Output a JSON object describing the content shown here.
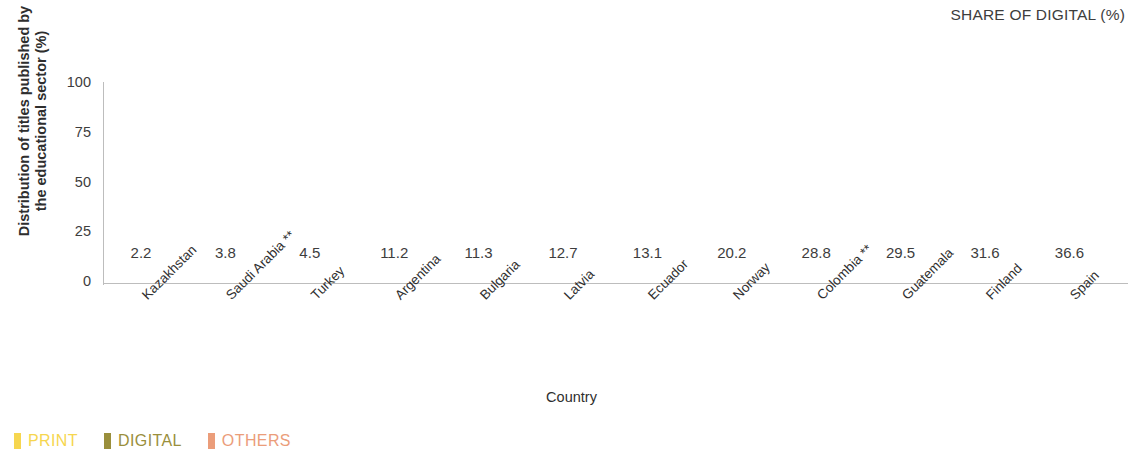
{
  "header": {
    "share_of_digital_title": "SHARE OF DIGITAL (%)"
  },
  "axes": {
    "y_title": "Distribution of titles published by the educational sector (%)",
    "x_title": "Country",
    "y_ticks": [
      "100",
      "75",
      "50",
      "25",
      "0"
    ]
  },
  "legend": {
    "items": [
      {
        "label": "PRINT",
        "color": "#f6d64f"
      },
      {
        "label": "DIGITAL",
        "color": "#9a8f3c"
      },
      {
        "label": "OTHERS",
        "color": "#eb9d7a"
      }
    ]
  },
  "chart_data": {
    "type": "bar",
    "title": "",
    "subtitle": "",
    "xlabel": "Country",
    "ylabel": "Distribution of titles published by the educational sector (%)",
    "ylim": [
      0,
      100
    ],
    "yticks": [
      0,
      25,
      50,
      75,
      100
    ],
    "grid": false,
    "stacked": true,
    "legend_position": "bottom-left",
    "annotation_row_title": "SHARE OF DIGITAL (%)",
    "categories": [
      "Kazakhstan",
      "Saudi Arabia **",
      "Turkey",
      "Argentina",
      "Bulgaria",
      "Latvia",
      "Ecuador",
      "Norway",
      "Colombia **",
      "Guatemala",
      "Finland",
      "Spain"
    ],
    "share_of_digital": [
      2.2,
      3.8,
      4.5,
      11.2,
      11.3,
      12.7,
      13.1,
      20.2,
      28.8,
      29.5,
      31.6,
      36.6
    ],
    "series": [
      {
        "name": "PRINT",
        "color": "#f6d64f",
        "values": [
          97.8,
          96.2,
          95.5,
          88.8,
          88.7,
          86.0,
          86.9,
          79.8,
          71.2,
          70.5,
          66.4,
          62.1
        ]
      },
      {
        "name": "DIGITAL",
        "color": "#9a8f3c",
        "values": [
          2.2,
          3.8,
          4.5,
          11.2,
          11.3,
          12.7,
          13.1,
          20.2,
          28.8,
          29.5,
          31.6,
          36.6
        ]
      },
      {
        "name": "OTHERS",
        "color": "#eb9d7a",
        "values": [
          0.0,
          0.0,
          0.0,
          0.0,
          0.0,
          1.3,
          0.0,
          0.0,
          0.0,
          0.0,
          2.0,
          1.3
        ]
      }
    ]
  }
}
